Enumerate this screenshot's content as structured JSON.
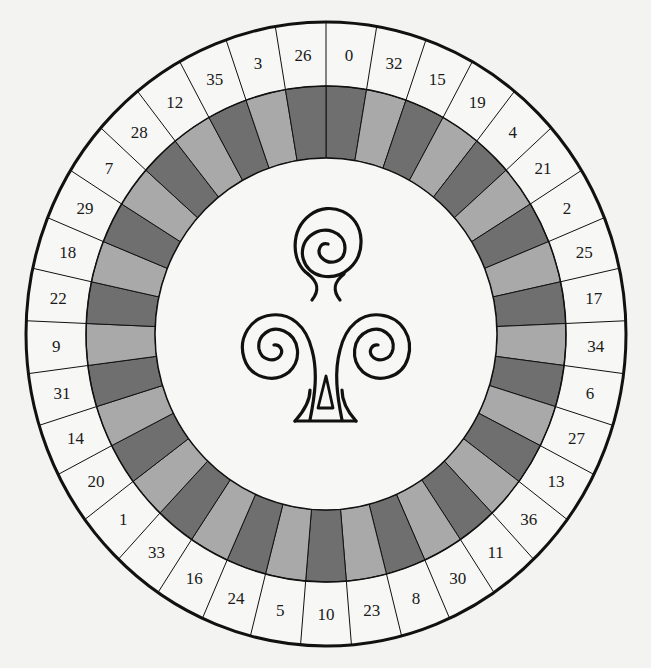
{
  "figure": {
    "title": "",
    "symbol": "club-spiral-icon",
    "wheel_sequence_clockwise_from_top": [
      0,
      32,
      15,
      19,
      4,
      21,
      2,
      25,
      17,
      34,
      6,
      27,
      13,
      36,
      11,
      30,
      8,
      23,
      10,
      5,
      24,
      16,
      33,
      1,
      20,
      14,
      31,
      9,
      22,
      18,
      29,
      7,
      28,
      12,
      35,
      3,
      26
    ],
    "band_shading_rule": "even index = dark, odd index = light",
    "colors": {
      "background": "#f3f3f1",
      "number_ring": "#f7f7f5",
      "dark_band": "#6f6f6f",
      "light_band": "#a9a9a9",
      "center": "#f7f7f5",
      "stroke": "#111111"
    },
    "geometry": {
      "center": [
        326,
        334
      ],
      "outer_rx": 300,
      "outer_ry": 312,
      "mid_rx": 240,
      "mid_ry": 248,
      "inner_rx": 171,
      "inner_ry": 176
    }
  }
}
